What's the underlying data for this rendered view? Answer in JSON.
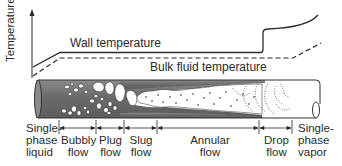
{
  "diagram": {
    "axis": {
      "ylabel": "Temperature"
    },
    "curves": [
      {
        "name": "Wall temperature",
        "style": "solid"
      },
      {
        "name": "Bulk fluid temperature",
        "style": "dashed"
      }
    ],
    "regimes": [
      {
        "id": "single-phase-liquid",
        "line1": "Single-",
        "line2": "phase",
        "line3": "liquid"
      },
      {
        "id": "bubbly-flow",
        "line1": "Bubbly",
        "line2": "flow"
      },
      {
        "id": "plug-flow",
        "line1": "Plug",
        "line2": "flow"
      },
      {
        "id": "slug-flow",
        "line1": "Slug",
        "line2": "flow"
      },
      {
        "id": "annular-flow",
        "line1": "Annular",
        "line2": "flow"
      },
      {
        "id": "drop-flow",
        "line1": "Drop",
        "line2": "flow"
      },
      {
        "id": "single-phase-vapor",
        "line1": "Single-",
        "line2": "phase",
        "line3": "vapor"
      }
    ],
    "colors": {
      "liquid": "#6e6e6e",
      "vapor": "#ffffff",
      "line": "#2a2a2a",
      "pipe_edge": "#333333"
    }
  }
}
